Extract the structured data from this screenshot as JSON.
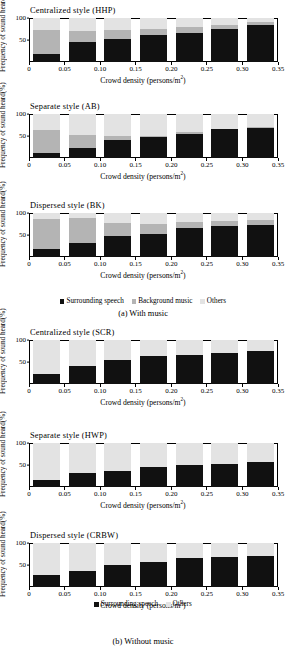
{
  "figure": {
    "ylabel": "Frequency of sound heard(%)",
    "xlabel_main": "Crowd density (persons/m",
    "xlabel_sup": "2",
    "xlabel_end": ")",
    "yticks": [
      "100",
      "50"
    ],
    "xticks": [
      "0",
      "0.05",
      "0.10",
      "0.15",
      "0.20",
      "0.25",
      "0.30",
      "0.35"
    ],
    "colors": {
      "surrounding_speech": "#111111",
      "background_music": "#b4b4b4",
      "others": "#e3e3e3",
      "axis": "#000000"
    }
  },
  "groups": [
    {
      "caption": "(a) With music",
      "legend": [
        {
          "label": "Surrounding speech",
          "swatch": "s1"
        },
        {
          "label": "Background music",
          "swatch": "s2"
        },
        {
          "label": "Others",
          "swatch": "s3"
        }
      ],
      "charts": [
        {
          "title": "Centralized style (HHP)",
          "chart_data": {
            "type": "bar",
            "title": "Centralized style (HHP)",
            "stacked": true,
            "xlabel": "Crowd density (persons/m2)",
            "ylabel": "Frequency of sound heard(%)",
            "ylim": [
              0,
              100
            ],
            "xlim": [
              0,
              0.35
            ],
            "grid": false,
            "legend_position": "below-group",
            "categories": [
              0.025,
              0.075,
              0.125,
              0.175,
              0.225,
              0.275,
              0.325
            ],
            "series": [
              {
                "name": "Surrounding speech",
                "values": [
                  18,
                  46,
                  52,
                  61,
                  66,
                  74,
                  84
                ]
              },
              {
                "name": "Background music",
                "values": [
                  54,
                  25,
                  21,
                  14,
                  13,
                  10,
                  7
                ]
              },
              {
                "name": "Others",
                "values": [
                  28,
                  29,
                  27,
                  25,
                  21,
                  16,
                  9
                ]
              }
            ]
          }
        },
        {
          "title": "Separate style (AB)",
          "chart_data": {
            "type": "bar",
            "title": "Separate style (AB)",
            "stacked": true,
            "xlabel": "Crowd density (persons/m2)",
            "ylabel": "Frequency of sound heard(%)",
            "ylim": [
              0,
              100
            ],
            "xlim": [
              0,
              0.35
            ],
            "grid": false,
            "legend_position": "below-group",
            "categories": [
              0.025,
              0.075,
              0.125,
              0.175,
              0.225,
              0.275,
              0.325
            ],
            "series": [
              {
                "name": "Surrounding speech",
                "values": [
                  12,
                  23,
                  42,
                  47,
                  55,
                  65,
                  68
                ]
              },
              {
                "name": "Background music",
                "values": [
                  52,
                  30,
                  7,
                  4,
                  5,
                  2,
                  2
                ]
              },
              {
                "name": "Others",
                "values": [
                  36,
                  47,
                  51,
                  49,
                  40,
                  33,
                  30
                ]
              }
            ]
          }
        },
        {
          "title": "Dispersed style (BK)",
          "chart_data": {
            "type": "bar",
            "title": "Dispersed style (BK)",
            "stacked": true,
            "xlabel": "Crowd density (persons/m2)",
            "ylabel": "Frequency of sound heard(%)",
            "ylim": [
              0,
              100
            ],
            "xlim": [
              0,
              0.35
            ],
            "grid": false,
            "legend_position": "below-group",
            "categories": [
              0.025,
              0.075,
              0.125,
              0.175,
              0.225,
              0.275,
              0.325
            ],
            "series": [
              {
                "name": "Surrounding speech",
                "values": [
                  18,
                  31,
                  48,
                  52,
                  66,
                  71,
                  73
                ]
              },
              {
                "name": "Background music",
                "values": [
                  68,
                  58,
                  30,
                  23,
                  14,
                  12,
                  12
                ]
              },
              {
                "name": "Others",
                "values": [
                  14,
                  11,
                  22,
                  25,
                  20,
                  17,
                  15
                ]
              }
            ]
          }
        }
      ]
    },
    {
      "caption": "(b) Without music",
      "legend": [
        {
          "label": "Surrounding speech",
          "swatch": "s1"
        },
        {
          "label": "Others",
          "swatch": "s3"
        }
      ],
      "charts": [
        {
          "title": "Centralized style (SCR)",
          "chart_data": {
            "type": "bar",
            "title": "Centralized style (SCR)",
            "stacked": true,
            "xlabel": "Crowd density (persons/m2)",
            "ylabel": "Frequency of sound heard(%)",
            "ylim": [
              0,
              100
            ],
            "xlim": [
              0,
              0.35
            ],
            "grid": false,
            "legend_position": "below-group",
            "categories": [
              0.025,
              0.075,
              0.125,
              0.175,
              0.225,
              0.275,
              0.325
            ],
            "series": [
              {
                "name": "Surrounding speech",
                "values": [
                  22,
                  42,
                  54,
                  64,
                  67,
                  70,
                  76
                ]
              },
              {
                "name": "Others",
                "values": [
                  78,
                  58,
                  46,
                  36,
                  33,
                  30,
                  24
                ]
              }
            ]
          }
        },
        {
          "title": "Separate style (HWP)",
          "chart_data": {
            "type": "bar",
            "title": "Separate style (HWP)",
            "stacked": true,
            "xlabel": "Crowd density (persons/m2)",
            "ylabel": "Frequency of sound heard(%)",
            "ylim": [
              0,
              100
            ],
            "xlim": [
              0,
              0.35
            ],
            "grid": false,
            "legend_position": "below-group",
            "categories": [
              0.025,
              0.075,
              0.125,
              0.175,
              0.225,
              0.275,
              0.325
            ],
            "series": [
              {
                "name": "Surrounding speech",
                "values": [
                  16,
                  32,
                  37,
                  45,
                  51,
                  53,
                  56
                ]
              },
              {
                "name": "Others",
                "values": [
                  84,
                  68,
                  63,
                  55,
                  49,
                  47,
                  44
                ]
              }
            ]
          }
        },
        {
          "title": "Dispersed style (CRBW)",
          "chart_data": {
            "type": "bar",
            "title": "Dispersed style (CRBW)",
            "stacked": true,
            "xlabel": "Crowd density (persons/m2)",
            "ylabel": "Frequency of sound heard(%)",
            "ylim": [
              0,
              100
            ],
            "xlim": [
              0,
              0.35
            ],
            "grid": false,
            "legend_position": "below-group",
            "categories": [
              0.025,
              0.075,
              0.125,
              0.175,
              0.225,
              0.275,
              0.325
            ],
            "series": [
              {
                "name": "Surrounding speech",
                "values": [
                  27,
                  36,
                  50,
                  56,
                  67,
                  68,
                  70
                ]
              },
              {
                "name": "Others",
                "values": [
                  73,
                  64,
                  50,
                  44,
                  33,
                  32,
                  30
                ]
              }
            ]
          }
        }
      ]
    }
  ]
}
